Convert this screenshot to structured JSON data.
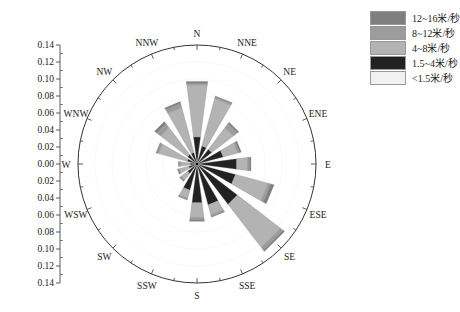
{
  "chart_data": {
    "type": "wind-rose",
    "title": "",
    "directions": [
      "N",
      "NNE",
      "NE",
      "ENE",
      "E",
      "ESE",
      "SE",
      "SSE",
      "S",
      "SSW",
      "SW",
      "WSW",
      "W",
      "WNW",
      "NW",
      "NNW"
    ],
    "radial_axis": {
      "ticks": [
        "0.14",
        "0.12",
        "0.10",
        "0.08",
        "0.06",
        "0.04",
        "0.02",
        "0.00",
        "0.02",
        "0.04",
        "0.06",
        "0.08",
        "0.10",
        "0.12",
        "0.14"
      ],
      "max": 0.14,
      "step": 0.02
    },
    "series": [
      {
        "name": "<1.5米/秒",
        "color": "#f2f2f2",
        "values": [
          0.002,
          0.002,
          0.002,
          0.002,
          0.002,
          0.002,
          0.002,
          0.002,
          0.002,
          0.002,
          0.002,
          0.002,
          0.002,
          0.002,
          0.002,
          0.002
        ]
      },
      {
        "name": "1.5~4米/秒",
        "color": "#222222",
        "values": [
          0.03,
          0.02,
          0.02,
          0.03,
          0.045,
          0.045,
          0.058,
          0.048,
          0.044,
          0.03,
          0.012,
          0.008,
          0.006,
          0.01,
          0.012,
          0.012
        ]
      },
      {
        "name": "4~8米/秒",
        "color": "#b3b3b3",
        "values": [
          0.062,
          0.058,
          0.032,
          0.018,
          0.013,
          0.04,
          0.064,
          0.012,
          0.018,
          0.01,
          0.01,
          0.012,
          0.012,
          0.035,
          0.04,
          0.055
        ]
      },
      {
        "name": "8~12米/秒",
        "color": "#9c9c9c",
        "values": [
          0.002,
          0.002,
          0.006,
          0.002,
          0.002,
          0.003,
          0.004,
          0.002,
          0.002,
          0.001,
          0.001,
          0.001,
          0.001,
          0.002,
          0.006,
          0.005
        ]
      },
      {
        "name": "12~16米/秒",
        "color": "#7f7f7f",
        "values": [
          0.002,
          0.001,
          0.002,
          0.002,
          0.002,
          0.004,
          0.002,
          0.001,
          0.002,
          0.001,
          0.001,
          0.001,
          0.001,
          0.001,
          0.003,
          0.002
        ]
      }
    ],
    "totals": [
      0.098,
      0.083,
      0.062,
      0.054,
      0.064,
      0.094,
      0.13,
      0.065,
      0.068,
      0.044,
      0.026,
      0.024,
      0.022,
      0.05,
      0.063,
      0.076
    ],
    "legend_position": "top-right"
  },
  "legend": [
    {
      "label": "12~16米/秒",
      "color": "#7f7f7f"
    },
    {
      "label": "8~12米/秒",
      "color": "#9c9c9c"
    },
    {
      "label": "4~8米/秒",
      "color": "#b3b3b3"
    },
    {
      "label": "1.5~4米/秒",
      "color": "#222222"
    },
    {
      "label": "<1.5米/秒",
      "color": "#f2f2f2"
    }
  ]
}
